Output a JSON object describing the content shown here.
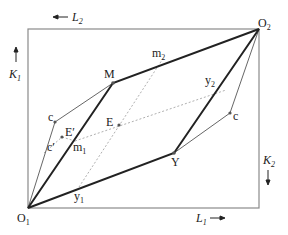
{
  "diagram": {
    "type": "edgeworth-box",
    "colors": {
      "box": "#8a8a8a",
      "thick": "#222222",
      "thin": "#555555",
      "dotted": "#b0b0b0",
      "point": "#555555"
    },
    "axes": {
      "L2": {
        "base": "L",
        "sub": "2",
        "arrow": "←"
      },
      "K1": {
        "base": "K",
        "sub": "1",
        "arrow": "↑"
      },
      "K2": {
        "base": "K",
        "sub": "2",
        "arrow": "↓"
      },
      "L1": {
        "base": "L",
        "sub": "1",
        "arrow": "→"
      }
    },
    "origins": {
      "O1": {
        "base": "O",
        "sub": "1"
      },
      "O2": {
        "base": "O",
        "sub": "2"
      }
    },
    "points": {
      "M": "M",
      "Y": "Y",
      "E": "E",
      "E_prime": "E′",
      "c_left": "c",
      "c_prime": "c′",
      "c_right": "c",
      "m1": {
        "base": "m",
        "sub": "1"
      },
      "m2": {
        "base": "m",
        "sub": "2"
      },
      "y1": {
        "base": "y",
        "sub": "1"
      },
      "y2": {
        "base": "y",
        "sub": "2"
      }
    }
  }
}
